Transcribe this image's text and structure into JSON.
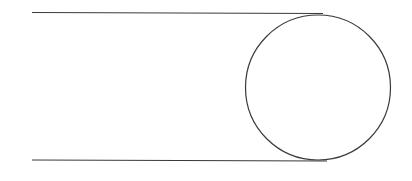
{
  "diagram": {
    "stroke_color": "#3a3a3a",
    "background": "#ffffff",
    "top_line": {
      "x1": 32,
      "y1": 12.5,
      "x2": 323,
      "y2": 13.5
    },
    "bottom_line": {
      "x1": 32,
      "y1": 160,
      "x2": 327,
      "y2": 161
    },
    "circle": {
      "cx": 318,
      "cy": 87.5,
      "r": 72.5
    }
  }
}
